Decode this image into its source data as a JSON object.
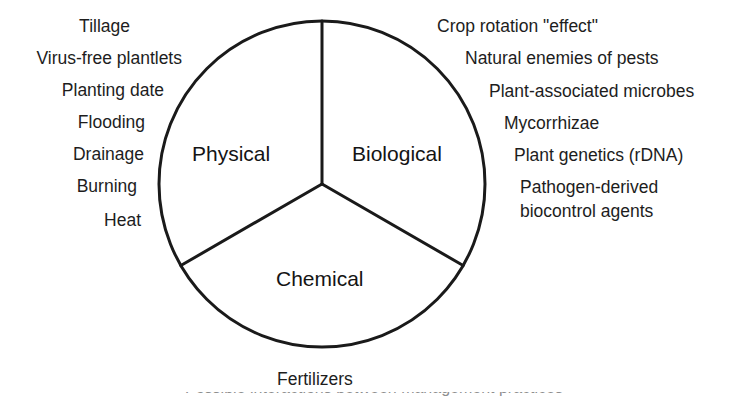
{
  "figure": {
    "type": "venn-like-pie-diagram",
    "background_color": "#ffffff",
    "stroke_color": "#1a1a1a",
    "circle": {
      "center_x": 322,
      "center_y": 184,
      "radius": 163,
      "stroke_width": 3
    },
    "sectors": [
      {
        "name": "physical",
        "label": "Physical",
        "label_x": 192,
        "label_y": 143
      },
      {
        "name": "biological",
        "label": "Biological",
        "label_x": 352,
        "label_y": 143
      },
      {
        "name": "chemical",
        "label": "Chemical",
        "label_x": 276,
        "label_y": 268
      }
    ],
    "dividers": [
      {
        "name": "divider-top",
        "angle_deg": 0
      },
      {
        "name": "divider-lower-left",
        "angle_deg": 120
      },
      {
        "name": "divider-lower-right",
        "angle_deg": 240
      }
    ]
  },
  "left_labels": {
    "group_name": "physical-factor-labels",
    "items": [
      {
        "text": "Tillage",
        "right": 618,
        "top": 18
      },
      {
        "text": "Virus-free plantlets",
        "right": 566,
        "top": 50
      },
      {
        "text": "Planting date",
        "right": 584,
        "top": 82
      },
      {
        "text": "Flooding",
        "right": 603,
        "top": 114
      },
      {
        "text": "Drainage",
        "right": 604,
        "top": 146
      },
      {
        "text": "Burning",
        "right": 611,
        "top": 178
      },
      {
        "text": "Heat",
        "right": 607,
        "top": 212
      }
    ]
  },
  "right_labels": {
    "group_name": "biological-factor-labels",
    "items": [
      {
        "text": "Crop rotation \"effect\"",
        "left": 437,
        "top": 18
      },
      {
        "text": "Natural enemies of pests",
        "left": 465,
        "top": 50
      },
      {
        "text": "Plant-associated microbes",
        "left": 489,
        "top": 83
      },
      {
        "text": "Mycorrhizae",
        "left": 504,
        "top": 115
      },
      {
        "text": "Plant genetics (rDNA)",
        "left": 514,
        "top": 147
      },
      {
        "text": "Pathogen-derived",
        "left": 520,
        "top": 179
      },
      {
        "text": "biocontrol agents",
        "left": 520,
        "top": 203
      }
    ]
  },
  "bottom_labels": {
    "group_name": "chemical-factor-labels",
    "items": [
      {
        "text": "Fertilizers",
        "left": 277,
        "top": 371
      }
    ]
  },
  "clipped_caption": {
    "name": "clipped-caption-remnant",
    "text": "Possible interactions between management practices",
    "top": 392
  }
}
